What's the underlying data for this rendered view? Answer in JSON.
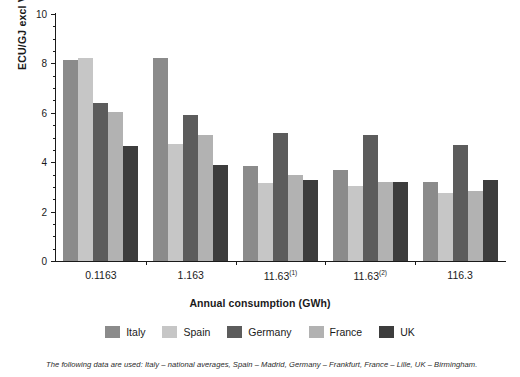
{
  "chart_data": {
    "type": "bar",
    "title": "",
    "xlabel": "Annual consumption (GWh)",
    "ylabel": "ECU/GJ excl VAT",
    "categories": [
      "0.1163",
      "1.163",
      "11.63",
      "11.63",
      "116.3"
    ],
    "category_superscripts": [
      "",
      "",
      "(1)",
      "(2)",
      ""
    ],
    "ylim": [
      0,
      10
    ],
    "yticks": [
      0,
      2,
      4,
      6,
      8,
      10
    ],
    "ytick_labels": [
      "0",
      "2",
      "4",
      "6",
      "8",
      "10"
    ],
    "minor_tick_step": 0.5,
    "grid": false,
    "legend_position": "bottom",
    "series": [
      {
        "name": "Italy",
        "color": "#8b8b8b",
        "values": [
          8.15,
          8.2,
          3.85,
          3.7,
          3.2
        ]
      },
      {
        "name": "Spain",
        "color": "#c6c6c6",
        "values": [
          8.2,
          4.75,
          3.15,
          3.05,
          2.75
        ]
      },
      {
        "name": "Germany",
        "color": "#5c5c5c",
        "values": [
          6.4,
          5.9,
          5.2,
          5.1,
          4.7
        ]
      },
      {
        "name": "France",
        "color": "#b2b2b2",
        "values": [
          6.05,
          5.1,
          3.5,
          3.2,
          2.85
        ]
      },
      {
        "name": "UK",
        "color": "#3d3d3d",
        "values": [
          4.65,
          3.9,
          3.3,
          3.2,
          3.3
        ]
      }
    ],
    "annotation": "The following data are used: Italy – national averages, Spain – Madrid, Germany – Frankfurt, France – Lille, UK – Birmingham."
  }
}
